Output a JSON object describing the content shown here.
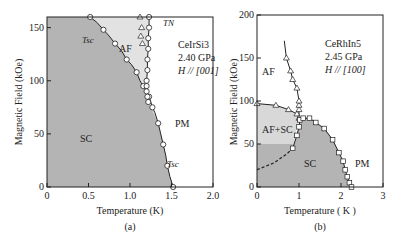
{
  "chart_data": [
    {
      "type": "line",
      "panel_label": "(a)",
      "material": "CeIrSi3",
      "pressure": "2.40 GPa",
      "field_dir": "H // [001]",
      "xlabel": "Temperature (K)",
      "ylabel": "Magnetic Field (kOe)",
      "xlim": [
        0,
        2.0
      ],
      "ylim": [
        0,
        160
      ],
      "xticks": [
        "0",
        "0.5",
        "1.0",
        "1.5",
        "2.0"
      ],
      "yticks": [
        "0",
        "50",
        "100",
        "150"
      ],
      "regions": [
        "SC",
        "AF",
        "PM"
      ],
      "curve_labels": [
        "T_sc",
        "T_N",
        "T_sc"
      ],
      "series": [
        {
          "name": "T_sc",
          "marker": "circle",
          "x": [
            1.52,
            1.48,
            1.45,
            1.43,
            1.4,
            1.37,
            1.34,
            1.3,
            1.27,
            1.25,
            1.23,
            1.2,
            1.16,
            1.12,
            1.08,
            1.02,
            0.96,
            0.9,
            0.82,
            0.75,
            0.68,
            0.6,
            0.52
          ],
          "y": [
            0,
            10,
            20,
            30,
            40,
            50,
            60,
            70,
            75,
            80,
            85,
            90,
            95,
            100,
            108,
            115,
            120,
            128,
            135,
            142,
            148,
            155,
            160
          ]
        },
        {
          "name": "T_N",
          "marker": "circle",
          "x": [
            1.23,
            1.23,
            1.22,
            1.22,
            1.21,
            1.21,
            1.2,
            1.2,
            1.2,
            1.21,
            1.22
          ],
          "y": [
            160,
            150,
            140,
            130,
            120,
            110,
            100,
            95,
            90,
            85,
            80
          ]
        },
        {
          "name": "T_N-triangle",
          "marker": "triangle",
          "x": [
            1.12,
            1.14,
            1.13,
            1.15
          ],
          "y": [
            160,
            150,
            142,
            135
          ]
        }
      ]
    },
    {
      "type": "line",
      "panel_label": "(b)",
      "material": "CeRhIn5",
      "pressure": "2.45 GPa",
      "field_dir": "H // [100]",
      "xlabel": "Temperature ( K )",
      "ylabel": "Magnetic Field (kOe)",
      "xlim": [
        0,
        3
      ],
      "ylim": [
        0,
        200
      ],
      "xticks": [
        "0",
        "1",
        "2",
        "3"
      ],
      "yticks": [
        "0",
        "50",
        "100",
        "150",
        "200"
      ],
      "regions": [
        "AF",
        "AF+SC",
        "SC",
        "PM"
      ],
      "series": [
        {
          "name": "T_N",
          "marker": "triangle",
          "x": [
            0.0,
            0.45,
            0.75,
            0.95,
            1.0,
            1.0,
            1.0,
            1.0,
            0.95,
            0.85,
            0.8,
            0.7,
            0.65
          ],
          "y": [
            97,
            95,
            90,
            85,
            80,
            90,
            95,
            100,
            115,
            125,
            135,
            150,
            170
          ]
        },
        {
          "name": "T_c",
          "marker": "square",
          "x": [
            0.85,
            0.95,
            1.0,
            1.02,
            1.1,
            1.25,
            1.4,
            1.6,
            1.8,
            1.95,
            2.05,
            2.1,
            2.15,
            2.2,
            2.25
          ],
          "y": [
            45,
            60,
            70,
            78,
            80,
            80,
            75,
            68,
            55,
            40,
            30,
            20,
            12,
            5,
            0
          ]
        },
        {
          "name": "T_c-dashed",
          "marker": "none",
          "x": [
            0,
            0.4,
            0.7,
            0.85
          ],
          "y": [
            20,
            28,
            38,
            45
          ]
        }
      ]
    }
  ]
}
